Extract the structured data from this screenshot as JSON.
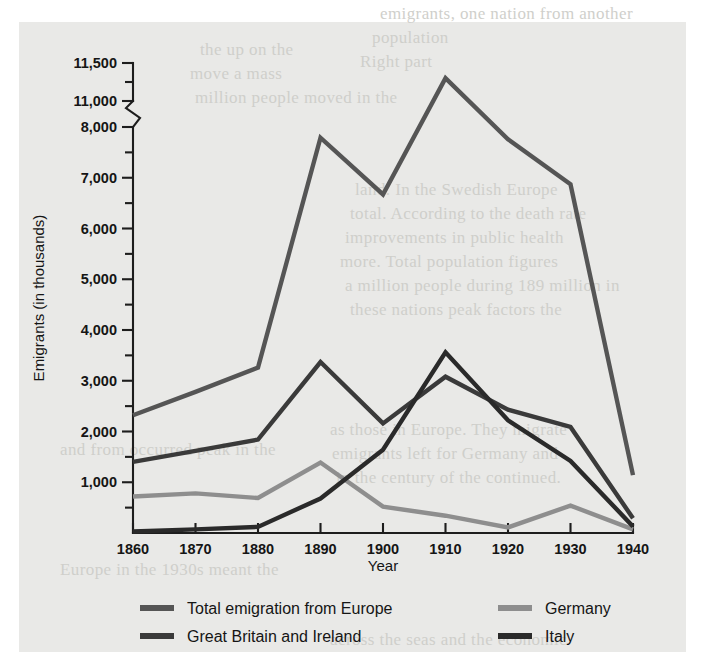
{
  "chart_data": {
    "type": "line",
    "title": "",
    "xlabel": "Year",
    "ylabel": "Emigrants (in thousands)",
    "x": [
      1860,
      1870,
      1880,
      1890,
      1900,
      1910,
      1920,
      1930,
      1940
    ],
    "xtick_labels": [
      "1860",
      "1870",
      "1880",
      "1890",
      "1900",
      "1910",
      "1920",
      "1930",
      "1940"
    ],
    "ytick_labels": [
      "1,000",
      "2,000",
      "3,000",
      "4,000",
      "5,000",
      "6,000",
      "7,000",
      "8,000",
      "11,000",
      "11,500"
    ],
    "ytick_values": [
      1000,
      2000,
      3000,
      4000,
      5000,
      6000,
      7000,
      8000,
      11000,
      11500
    ],
    "yminor_values": [
      500,
      1500,
      2500,
      3500,
      4500,
      5500,
      6500,
      7500,
      11250
    ],
    "ylim": [
      0,
      11500
    ],
    "axis_break": {
      "between": [
        8000,
        11000
      ],
      "style": "zigzag"
    },
    "grid": false,
    "legend_position": "below-plot",
    "series": [
      {
        "name": "Total emigration from Europe",
        "color": "#555555",
        "values": [
          2320,
          2780,
          3260,
          7790,
          6670,
          11300,
          7760,
          6870,
          1140
        ]
      },
      {
        "name": "Great Britain and Ireland",
        "color": "#3a3a3a",
        "values": [
          1400,
          1620,
          1840,
          3370,
          2160,
          3080,
          2430,
          2090,
          290
        ]
      },
      {
        "name": "Germany",
        "color": "#8e8e8e",
        "values": [
          720,
          780,
          690,
          1390,
          520,
          340,
          110,
          540,
          70
        ]
      },
      {
        "name": "Italy",
        "color": "#2a2a2a",
        "values": [
          30,
          70,
          120,
          680,
          1640,
          3560,
          2220,
          1420,
          130
        ]
      }
    ]
  },
  "legend": {
    "entries": [
      {
        "label": "Total emigration from Europe",
        "color": "#555555"
      },
      {
        "label": "Great Britain and Ireland",
        "color": "#3a3a3a"
      },
      {
        "label": "Germany",
        "color": "#8e8e8e"
      },
      {
        "label": "Italy",
        "color": "#2a2a2a"
      }
    ]
  },
  "page_ghost_text": {
    "lines": [
      "emigrants, one nation from another",
      "population",
      "Right part",
      "the up on the",
      "move a mass",
      "million people moved in the",
      "land. In the Swedish Europe",
      "total. According to the death rate",
      "improvements in public health",
      "more. Total population figures",
      "a million people during 189 million in",
      "these nations peak factors the",
      "as those in Europe. They migrate",
      "emigrants left for Germany and",
      "in the century of the continued.",
      "and from occurred peak in the",
      "Europe in the 1930s meant the",
      "across the seas and the economic"
    ]
  }
}
